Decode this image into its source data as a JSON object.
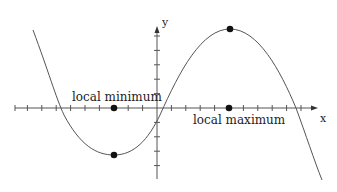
{
  "diagram": {
    "type": "function-graph",
    "axes": {
      "x_label": "x",
      "y_label": "y",
      "color": "#555555"
    },
    "labels": {
      "local_min": "local minimum",
      "local_max": "local maximum"
    },
    "points": {
      "local_min": {
        "x_units": -3,
        "y_units": -3.3
      },
      "local_max": {
        "x_units": 5,
        "y_units": 5.5
      }
    },
    "colors": {
      "curve": "#555555",
      "dots": "#111111",
      "text": "#222222"
    }
  }
}
